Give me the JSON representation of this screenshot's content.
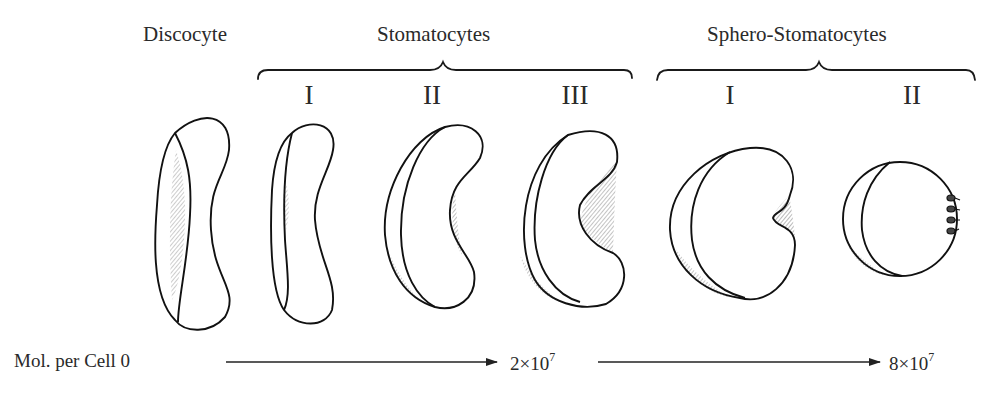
{
  "figure": {
    "group_labels": {
      "discocyte": "Discocyte",
      "stomatocytes": "Stomatocytes",
      "sphero_stomatocytes": "Sphero-Stomatocytes"
    },
    "stage_labels": {
      "stomatocyte_1": "I",
      "stomatocyte_2": "II",
      "stomatocyte_3": "III",
      "sphero_1": "I",
      "sphero_2": "II"
    },
    "cells": [
      {
        "name": "Discocyte",
        "shape": "biconcave disc"
      },
      {
        "name": "Stomatocyte I",
        "shape": "slightly cupped"
      },
      {
        "name": "Stomatocyte II",
        "shape": "cup"
      },
      {
        "name": "Stomatocyte III",
        "shape": "deep cup"
      },
      {
        "name": "Sphero-Stomatocyte I",
        "shape": "sphere with small stoma"
      },
      {
        "name": "Sphero-Stomatocyte II",
        "shape": "sphere with budding vesicles"
      }
    ],
    "axis": {
      "label": "Mol. per Cell",
      "start": "0",
      "mid_base": "2×10",
      "mid_exp": "7",
      "end_base": "8×10",
      "end_exp": "7"
    }
  }
}
